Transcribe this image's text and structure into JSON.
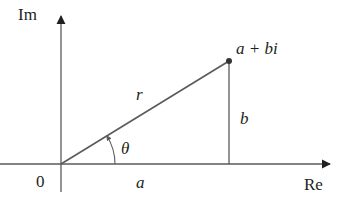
{
  "diagram": {
    "axes": {
      "imaginary_label": "Im",
      "real_label": "Re",
      "origin_label": "0"
    },
    "point": {
      "label": "a + bi"
    },
    "segments": {
      "modulus_label": "r",
      "imag_part_label": "b",
      "real_part_label": "a"
    },
    "angle": {
      "label": "θ"
    },
    "colors": {
      "axis": "#5a5a5a",
      "line": "#5a5a5a",
      "text": "#231f20",
      "point": "#333333"
    }
  }
}
